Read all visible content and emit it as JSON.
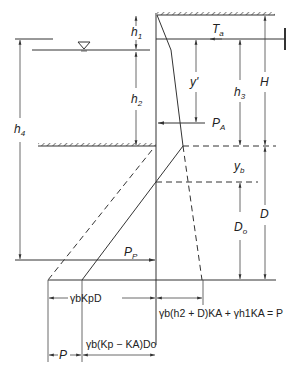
{
  "diagram": {
    "labels": {
      "h1": {
        "base": "h",
        "sub": "1"
      },
      "h2": {
        "base": "h",
        "sub": "2"
      },
      "h3": {
        "base": "h",
        "sub": "3"
      },
      "h4": {
        "base": "h",
        "sub": "4"
      },
      "H": "H",
      "D": "D",
      "Do": {
        "base": "D",
        "sub": "o"
      },
      "yb": {
        "base": "y",
        "sub": "b"
      },
      "yprime": "y'",
      "Ta": {
        "base": "T",
        "sub": "a"
      },
      "PA": {
        "base": "P",
        "sub": "A"
      },
      "PP": {
        "base": "P",
        "sub": "P"
      },
      "P": "P"
    },
    "equations": {
      "passive_width": "γbKpD",
      "active_pressure": "γb(h2 + D)KA + γh1KA = P",
      "net_passive": "γb(Kp − KA)Do"
    },
    "symbols": {
      "water_table": "water-table-triangle",
      "ground_surface": "hatched-ground",
      "anchor": "tie-rod-anchor"
    },
    "colors": {
      "line": "#333333",
      "hatch": "#555555",
      "background": "#ffffff"
    }
  }
}
